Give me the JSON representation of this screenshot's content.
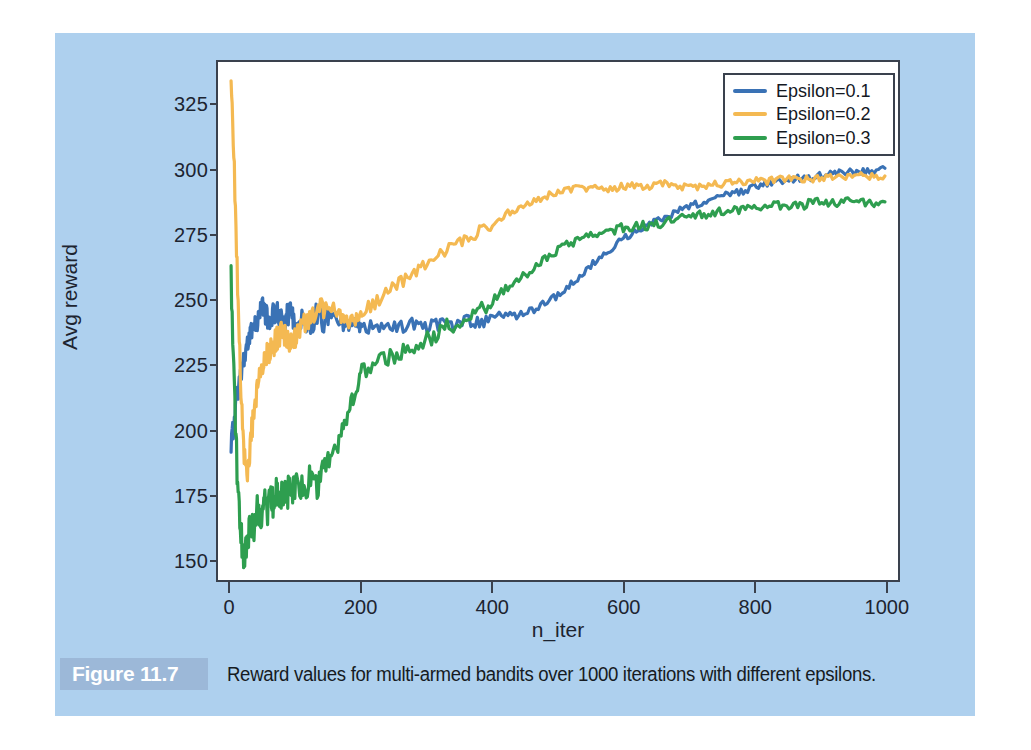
{
  "figure": {
    "badge_label": "Figure 11.7",
    "caption": "Reward values for multi-armed bandits over 1000 iterations with different epsilons.",
    "panel_color": "#aed0ee",
    "badge_color": "#9cb8d8"
  },
  "legend": {
    "position": "top-right",
    "entries": [
      {
        "label": "Epsilon=0.1",
        "color": "#3a72b5"
      },
      {
        "label": "Epsilon=0.2",
        "color": "#f4b952"
      },
      {
        "label": "Epsilon=0.3",
        "color": "#2e9e4f"
      }
    ]
  },
  "axes": {
    "xlabel": "n_iter",
    "ylabel": "Avg reward",
    "xticks": [
      "0",
      "200",
      "400",
      "600",
      "800",
      "1000"
    ],
    "yticks": [
      "150",
      "175",
      "200",
      "225",
      "250",
      "275",
      "300",
      "325"
    ]
  },
  "chart_data": {
    "type": "line",
    "title": "",
    "xlabel": "n_iter",
    "ylabel": "Avg reward",
    "xlim": [
      -20,
      1020
    ],
    "ylim": [
      142,
      342
    ],
    "xticks": [
      0,
      200,
      400,
      600,
      800,
      1000
    ],
    "yticks": [
      150,
      175,
      200,
      225,
      250,
      275,
      300,
      325
    ],
    "grid": false,
    "legend_position": "upper right",
    "x": [
      0,
      5,
      10,
      15,
      20,
      25,
      30,
      35,
      40,
      45,
      50,
      55,
      60,
      65,
      70,
      75,
      80,
      85,
      90,
      95,
      100,
      110,
      120,
      130,
      140,
      150,
      160,
      170,
      180,
      190,
      200,
      220,
      240,
      260,
      280,
      300,
      320,
      340,
      360,
      380,
      400,
      420,
      440,
      460,
      480,
      500,
      520,
      540,
      560,
      580,
      600,
      620,
      640,
      660,
      680,
      700,
      720,
      740,
      760,
      780,
      800,
      820,
      840,
      860,
      880,
      900,
      920,
      940,
      960,
      980,
      1000
    ],
    "series": [
      {
        "name": "Epsilon=0.1",
        "color": "#3a72b5",
        "values": [
          193,
          205,
          214,
          221,
          228,
          233,
          236,
          240,
          243,
          245,
          247,
          244,
          241,
          245,
          247,
          243,
          240,
          244,
          246,
          242,
          240,
          243,
          241,
          244,
          242,
          245,
          243,
          241,
          240,
          241,
          239,
          240,
          239,
          240,
          241,
          240,
          241,
          240,
          242,
          241,
          243,
          245,
          244,
          246,
          249,
          252,
          256,
          261,
          266,
          270,
          274,
          277,
          280,
          282,
          284,
          286,
          288,
          290,
          291,
          292,
          294,
          295,
          296,
          297,
          297,
          298,
          299,
          299,
          300,
          300,
          301
        ]
      },
      {
        "name": "Epsilon=0.2",
        "color": "#f4b952",
        "values": [
          337,
          300,
          255,
          215,
          190,
          182,
          196,
          208,
          216,
          221,
          226,
          229,
          231,
          233,
          235,
          237,
          238,
          235,
          232,
          234,
          236,
          240,
          243,
          245,
          247,
          249,
          246,
          243,
          241,
          243,
          245,
          249,
          253,
          257,
          261,
          265,
          268,
          271,
          274,
          277,
          280,
          283,
          286,
          288,
          290,
          292,
          293,
          293,
          294,
          293,
          294,
          294,
          294,
          295,
          294,
          294,
          294,
          295,
          295,
          296,
          296,
          296,
          297,
          297,
          297,
          297,
          298,
          298,
          298,
          298,
          298
        ]
      },
      {
        "name": "Epsilon=0.3",
        "color": "#2e9e4f",
        "values": [
          258,
          215,
          178,
          160,
          150,
          158,
          165,
          158,
          170,
          163,
          172,
          168,
          175,
          170,
          176,
          172,
          177,
          174,
          178,
          176,
          179,
          177,
          180,
          178,
          182,
          186,
          192,
          199,
          207,
          215,
          222,
          226,
          228,
          230,
          232,
          235,
          238,
          241,
          244,
          247,
          250,
          254,
          258,
          262,
          266,
          269,
          272,
          274,
          276,
          277,
          278,
          279,
          279,
          280,
          281,
          282,
          283,
          284,
          285,
          285,
          286,
          286,
          287,
          287,
          287,
          288,
          288,
          288,
          288,
          288,
          288
        ]
      }
    ],
    "notes": {
      "initial_spike_epsilon_0_2": 337,
      "initial_value_epsilon_0_3": 258,
      "minimum_epsilon_0_3": 150,
      "final_values": {
        "Epsilon=0.1": 301,
        "Epsilon=0.2": 298,
        "Epsilon=0.3": 288
      }
    }
  }
}
